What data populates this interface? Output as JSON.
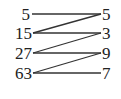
{
  "diagram": {
    "left": [
      "5",
      "15",
      "27",
      "63"
    ],
    "right": [
      "5",
      "3",
      "9",
      "7"
    ],
    "connections": [
      [
        0,
        0
      ],
      [
        1,
        0
      ],
      [
        1,
        1
      ],
      [
        2,
        1
      ],
      [
        2,
        2
      ],
      [
        3,
        2
      ],
      [
        3,
        3
      ]
    ]
  }
}
